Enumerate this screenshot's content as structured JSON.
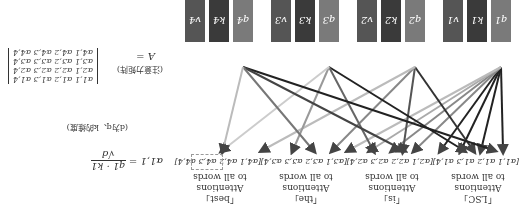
{
  "groups": [
    {
      "word": "「LSC」",
      "line1": "Attentions",
      "line2": "to all words",
      "vector": "[α1,1 α1,2 α1,3 α1,4]",
      "boxes": [
        "q1",
        "k1",
        "v1"
      ]
    },
    {
      "word": "「is」",
      "line1": "Attentions",
      "line2": "to all words",
      "vector": "[α2,1 α2,2 α2,3 α2,4]",
      "boxes": [
        "q2",
        "k2",
        "v2"
      ]
    },
    {
      "word": "「the」",
      "line1": "Attentions",
      "line2": "to all words",
      "vector": "[α3,1 α3,2 α3,3 α3,4]",
      "boxes": [
        "q3",
        "k3",
        "v3"
      ]
    },
    {
      "word": "「best」",
      "line1": "Attentions",
      "line2": "to all words",
      "vector": "[α4,1 α4,2 α4,3 α4,4]",
      "boxes": [
        "q4",
        "k4",
        "v4"
      ]
    }
  ],
  "formula": {
    "lhs": "α1,1 =",
    "num": "q1 · k1",
    "den": "√d",
    "note": "(d为q、k的维度)"
  },
  "matrix": {
    "label": "A  =",
    "note": "(注意力矩阵)",
    "rows": [
      [
        "α1,1",
        "α1,2",
        "α1,3",
        "α1,4"
      ],
      [
        "α2,1",
        "α2,2",
        "α2,3",
        "α2,4"
      ],
      [
        "α3,1",
        "α3,2",
        "α3,3",
        "α3,4"
      ],
      [
        "α4,1",
        "α4,2",
        "α4,3",
        "α4,4"
      ]
    ]
  },
  "colors": {
    "q": "#7a7a7a",
    "k": "#3a3a3a",
    "v": "#555555",
    "line_dark": "#222222",
    "line_mid": "#666666",
    "line_light": "#bbbbbb"
  }
}
